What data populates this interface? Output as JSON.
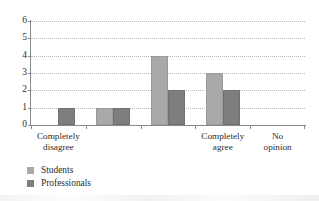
{
  "chart_data": {
    "type": "bar",
    "title": "",
    "subtitle": "",
    "xlabel": "",
    "ylabel": "",
    "ylim": [
      0,
      6
    ],
    "yticks": [
      0,
      1,
      2,
      3,
      4,
      5,
      6
    ],
    "ytick_labels": [
      "0",
      "1",
      "2",
      "3",
      "4",
      "5",
      "6"
    ],
    "grid": "horizontal-dotted",
    "legend_position": "bottom-left",
    "categories": [
      "Completely\ndisagree",
      "",
      "",
      "Completely\nagree",
      "No opinion"
    ],
    "category_labels_visible": [
      {
        "text": "Completely\ndisagree",
        "slot": 0
      },
      {
        "text": "Completely\nagree",
        "slot": 3
      },
      {
        "text": "No opinion",
        "slot": 4
      }
    ],
    "series": [
      {
        "name": "Students",
        "color": "#a9a9a9",
        "values": [
          0,
          1,
          4,
          3,
          0
        ]
      },
      {
        "name": "Professionals",
        "color": "#7e7e7e",
        "values": [
          1,
          1,
          2,
          2,
          0
        ]
      }
    ]
  },
  "legend": {
    "items": [
      {
        "label": "Students",
        "swatch": "#a9a9a9"
      },
      {
        "label": "Professionals",
        "swatch": "#7e7e7e"
      }
    ]
  },
  "axis": {
    "y_max_label": "6",
    "y_min_label": "0"
  }
}
